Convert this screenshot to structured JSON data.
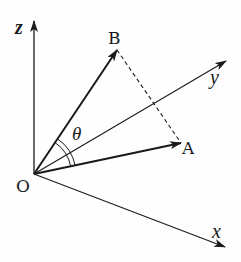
{
  "diagram": {
    "type": "3d-vector-angle",
    "origin_label": "O",
    "axes": [
      {
        "name": "z",
        "label": "z"
      },
      {
        "name": "y",
        "label": "y"
      },
      {
        "name": "x",
        "label": "x"
      }
    ],
    "points": [
      {
        "name": "A",
        "label": "A"
      },
      {
        "name": "B",
        "label": "B"
      }
    ],
    "angle_label": "θ",
    "vectors": [
      "OA",
      "OB"
    ],
    "dashed_segment": "AB",
    "colors": {
      "stroke": "#1a1a1a",
      "background": "#fefefe"
    }
  }
}
